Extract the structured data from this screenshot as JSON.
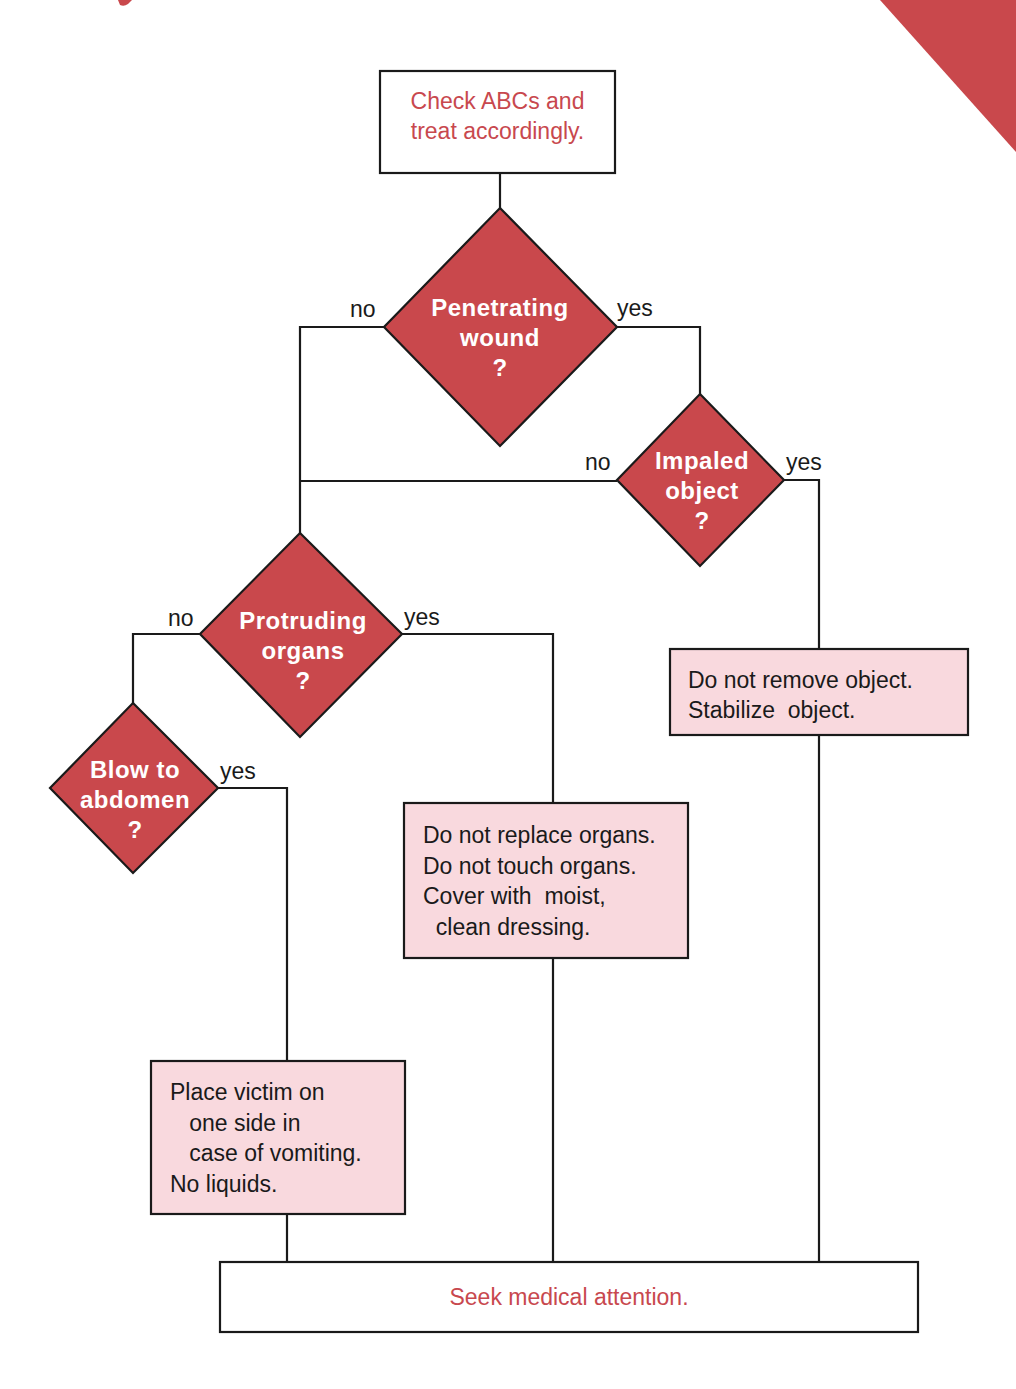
{
  "colors": {
    "decision_fill": "#c9484c",
    "action_fill": "#f9d9de",
    "terminal_text": "#c8484e",
    "line": "#1a1a1a",
    "background": "#ffffff",
    "corner_accent": "#c9484c"
  },
  "nodes": {
    "start": {
      "type": "terminal",
      "lines": [
        "Check ABCs and",
        "treat accordingly."
      ]
    },
    "penetrating": {
      "type": "decision",
      "lines": [
        "Penetrating",
        "wound",
        "?"
      ]
    },
    "impaled": {
      "type": "decision",
      "lines": [
        "Impaled",
        "object",
        "?"
      ]
    },
    "protruding": {
      "type": "decision",
      "lines": [
        "Protruding",
        "organs",
        "?"
      ]
    },
    "blow": {
      "type": "decision",
      "lines": [
        "Blow to",
        "abdomen",
        "?"
      ]
    },
    "object_action": {
      "type": "action",
      "lines": [
        "Do not remove object.",
        "Stabilize  object."
      ]
    },
    "organs_action": {
      "type": "action",
      "lines": [
        "Do not replace organs.",
        "Do not touch organs.",
        "Cover with  moist,",
        "  clean dressing."
      ]
    },
    "vomit_action": {
      "type": "action",
      "lines": [
        "Place victim on",
        "   one side in",
        "   case of vomiting.",
        "No liquids."
      ]
    },
    "end": {
      "type": "terminal",
      "lines": [
        "Seek medical attention."
      ]
    }
  },
  "branches": {
    "penetrating_no": "no",
    "penetrating_yes": "yes",
    "impaled_no": "no",
    "impaled_yes": "yes",
    "protruding_no": "no",
    "protruding_yes": "yes",
    "blow_yes": "yes"
  },
  "edges": [
    {
      "from": "start",
      "to": "penetrating",
      "label": ""
    },
    {
      "from": "penetrating",
      "to": "protruding",
      "label": "no"
    },
    {
      "from": "penetrating",
      "to": "impaled",
      "label": "yes"
    },
    {
      "from": "impaled",
      "to": "protruding",
      "label": "no"
    },
    {
      "from": "impaled",
      "to": "object_action",
      "label": "yes"
    },
    {
      "from": "protruding",
      "to": "blow",
      "label": "no"
    },
    {
      "from": "protruding",
      "to": "organs_action",
      "label": "yes"
    },
    {
      "from": "blow",
      "to": "vomit_action",
      "label": "yes"
    },
    {
      "from": "vomit_action",
      "to": "end",
      "label": ""
    },
    {
      "from": "organs_action",
      "to": "end",
      "label": ""
    },
    {
      "from": "object_action",
      "to": "end",
      "label": ""
    }
  ]
}
